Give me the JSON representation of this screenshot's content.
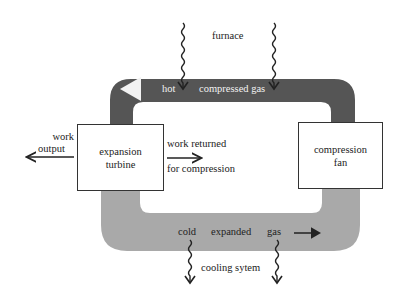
{
  "diagram": {
    "type": "closed-cycle gas turbine schematic",
    "colors": {
      "hot_pipe": "#555555",
      "cold_pipe": "#a9a9a9",
      "box_border": "#333333",
      "text": "#222222",
      "hot_text": "#f2f2f2"
    },
    "heat_source": {
      "label": "furnace"
    },
    "heat_sink": {
      "label": "cooling sytem"
    },
    "hot_pipe": {
      "label_hot": "hot",
      "label_gas": "compressed gas",
      "flow_direction": "left"
    },
    "cold_pipe": {
      "label_cold": "cold",
      "label_expanded": "expanded",
      "label_gas": "gas",
      "flow_direction": "right"
    },
    "turbine": {
      "line1": "expansion",
      "line2": "turbine"
    },
    "compressor": {
      "line1": "compression",
      "line2": "fan"
    },
    "work_output": {
      "line1": "work",
      "line2": "output"
    },
    "work_returned": {
      "line1": "work returned",
      "line2": "for compression"
    }
  }
}
